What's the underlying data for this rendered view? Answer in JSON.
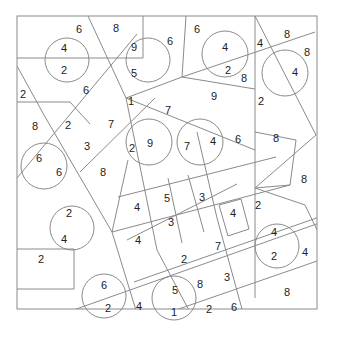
{
  "diagram": {
    "title": "",
    "colors": {
      "line": "#8a8a8a",
      "text": "#222222",
      "background": "#ffffff"
    },
    "border": {
      "x": 17,
      "y": 16,
      "w": 300,
      "h": 293
    },
    "lines": [
      [
        88,
        16,
        126,
        98
      ],
      [
        143,
        16,
        143,
        58
      ],
      [
        17,
        58,
        143,
        58
      ],
      [
        186,
        16,
        182,
        77
      ],
      [
        255,
        16,
        255,
        298
      ],
      [
        255,
        16,
        316,
        135
      ],
      [
        17,
        66,
        44,
        115
      ],
      [
        17,
        102,
        70,
        102
      ],
      [
        70,
        102,
        90,
        124
      ],
      [
        44,
        115,
        112,
        232
      ],
      [
        17,
        178,
        137,
        34
      ],
      [
        80,
        172,
        155,
        98
      ],
      [
        126,
        98,
        182,
        77
      ],
      [
        182,
        77,
        315,
        32
      ],
      [
        182,
        77,
        255,
        89
      ],
      [
        126,
        98,
        255,
        150
      ],
      [
        126,
        98,
        157,
        250
      ],
      [
        157,
        250,
        210,
        350
      ],
      [
        197,
        132,
        217,
        218
      ],
      [
        217,
        218,
        245,
        320
      ],
      [
        128,
        160,
        112,
        232
      ],
      [
        112,
        232,
        142,
        330
      ],
      [
        118,
        197,
        276,
        157
      ],
      [
        112,
        232,
        290,
        185
      ],
      [
        127,
        240,
        237,
        184
      ],
      [
        134,
        282,
        325,
        215
      ],
      [
        168,
        178,
        182,
        243
      ],
      [
        188,
        175,
        204,
        232
      ],
      [
        219,
        205,
        241,
        199
      ],
      [
        241,
        199,
        249,
        229
      ],
      [
        219,
        205,
        228,
        236
      ],
      [
        228,
        236,
        249,
        229
      ],
      [
        290,
        185,
        255,
        188
      ],
      [
        296,
        140,
        290,
        185
      ],
      [
        255,
        132,
        296,
        140
      ],
      [
        255,
        188,
        316,
        135
      ],
      [
        255,
        188,
        305,
        205
      ],
      [
        305,
        205,
        320,
        236
      ],
      [
        17,
        330,
        325,
        221
      ],
      [
        121,
        329,
        320,
        260
      ],
      [
        17,
        249,
        74,
        249
      ],
      [
        74,
        249,
        74,
        289
      ],
      [
        17,
        289,
        74,
        289
      ]
    ],
    "circles": [
      {
        "cx": 67,
        "cy": 60,
        "r": 22
      },
      {
        "cx": 148,
        "cy": 60,
        "r": 22
      },
      {
        "cx": 225,
        "cy": 54,
        "r": 23
      },
      {
        "cx": 285,
        "cy": 73,
        "r": 23
      },
      {
        "cx": 149,
        "cy": 142,
        "r": 23
      },
      {
        "cx": 200,
        "cy": 142,
        "r": 23
      },
      {
        "cx": 44,
        "cy": 166,
        "r": 23
      },
      {
        "cx": 72,
        "cy": 228,
        "r": 22
      },
      {
        "cx": 277,
        "cy": 246,
        "r": 22
      },
      {
        "cx": 104,
        "cy": 296,
        "r": 22
      },
      {
        "cx": 174,
        "cy": 298,
        "r": 22
      }
    ],
    "numbers": [
      {
        "x": 79,
        "y": 29,
        "v": "6"
      },
      {
        "x": 116,
        "y": 28,
        "v": "8"
      },
      {
        "x": 64,
        "y": 48,
        "v": "4"
      },
      {
        "x": 64,
        "y": 70,
        "v": "2"
      },
      {
        "x": 134,
        "y": 47,
        "v": "9"
      },
      {
        "x": 134,
        "y": 73,
        "v": "5"
      },
      {
        "x": 170,
        "y": 41,
        "v": "6"
      },
      {
        "x": 197,
        "y": 29,
        "v": "6"
      },
      {
        "x": 225,
        "y": 47,
        "v": "4"
      },
      {
        "x": 228,
        "y": 70,
        "v": "2"
      },
      {
        "x": 244,
        "y": 78,
        "v": "8"
      },
      {
        "x": 260,
        "y": 43,
        "v": "4"
      },
      {
        "x": 287,
        "y": 34,
        "v": "8"
      },
      {
        "x": 307,
        "y": 52,
        "v": "8"
      },
      {
        "x": 295,
        "y": 72,
        "v": "4"
      },
      {
        "x": 23,
        "y": 94,
        "v": "2"
      },
      {
        "x": 86,
        "y": 90,
        "v": "6"
      },
      {
        "x": 131,
        "y": 101,
        "v": "1"
      },
      {
        "x": 214,
        "y": 96,
        "v": "9"
      },
      {
        "x": 261,
        "y": 101,
        "v": "2"
      },
      {
        "x": 168,
        "y": 110,
        "v": "7"
      },
      {
        "x": 35,
        "y": 126,
        "v": "8"
      },
      {
        "x": 68,
        "y": 125,
        "v": "2"
      },
      {
        "x": 111,
        "y": 124,
        "v": "7"
      },
      {
        "x": 87,
        "y": 146,
        "v": "3"
      },
      {
        "x": 132,
        "y": 148,
        "v": "2"
      },
      {
        "x": 150,
        "y": 143,
        "v": "9"
      },
      {
        "x": 187,
        "y": 146,
        "v": "7"
      },
      {
        "x": 213,
        "y": 141,
        "v": "4"
      },
      {
        "x": 238,
        "y": 139,
        "v": "6"
      },
      {
        "x": 276,
        "y": 138,
        "v": "8"
      },
      {
        "x": 39,
        "y": 158,
        "v": "6"
      },
      {
        "x": 59,
        "y": 172,
        "v": "6"
      },
      {
        "x": 103,
        "y": 172,
        "v": "8"
      },
      {
        "x": 304,
        "y": 179,
        "v": "8"
      },
      {
        "x": 137,
        "y": 207,
        "v": "4"
      },
      {
        "x": 167,
        "y": 198,
        "v": "5"
      },
      {
        "x": 202,
        "y": 197,
        "v": "3"
      },
      {
        "x": 171,
        "y": 222,
        "v": "3"
      },
      {
        "x": 233,
        "y": 213,
        "v": "4"
      },
      {
        "x": 258,
        "y": 205,
        "v": "2"
      },
      {
        "x": 138,
        "y": 240,
        "v": "4"
      },
      {
        "x": 69,
        "y": 213,
        "v": "2"
      },
      {
        "x": 64,
        "y": 239,
        "v": "4"
      },
      {
        "x": 41,
        "y": 259,
        "v": "2"
      },
      {
        "x": 274,
        "y": 232,
        "v": "4"
      },
      {
        "x": 274,
        "y": 256,
        "v": "2"
      },
      {
        "x": 305,
        "y": 252,
        "v": "4"
      },
      {
        "x": 184,
        "y": 259,
        "v": "2"
      },
      {
        "x": 218,
        "y": 246,
        "v": "7"
      },
      {
        "x": 227,
        "y": 277,
        "v": "3"
      },
      {
        "x": 287,
        "y": 292,
        "v": "8"
      },
      {
        "x": 104,
        "y": 285,
        "v": "6"
      },
      {
        "x": 108,
        "y": 308,
        "v": "2"
      },
      {
        "x": 139,
        "y": 306,
        "v": "4"
      },
      {
        "x": 175,
        "y": 290,
        "v": "5"
      },
      {
        "x": 200,
        "y": 284,
        "v": "8"
      },
      {
        "x": 174,
        "y": 312,
        "v": "1"
      },
      {
        "x": 209,
        "y": 309,
        "v": "2"
      },
      {
        "x": 234,
        "y": 307,
        "v": "6"
      }
    ]
  }
}
